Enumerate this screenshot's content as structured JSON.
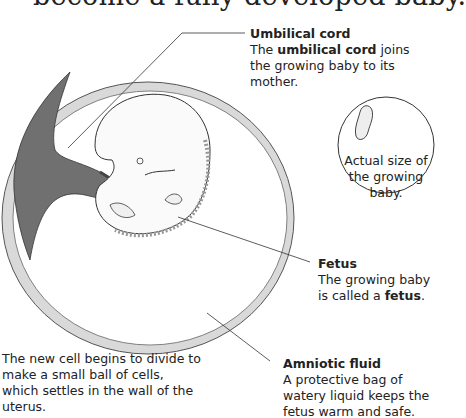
{
  "title": "become a fully developed baby.",
  "labels": {
    "umbilical_cord": {
      "heading": "Umbilical cord",
      "text_before": "The ",
      "bold": "umbilical cord",
      "text_after": " joins the growing baby to its mother."
    },
    "actual_size": {
      "text": "Actual size of the growing baby."
    },
    "fetus": {
      "heading": "Fetus",
      "text_before": "The growing baby is called a ",
      "bold": "fetus",
      "text_after": "."
    },
    "cell_division": {
      "text": "The new cell begins to divide to make a small ball of cells, which settles in the wall of the uterus."
    },
    "amniotic_fluid": {
      "heading": "Amniotic fluid",
      "text": "A protective bag of watery liquid keeps the fetus warm and safe."
    }
  },
  "colors": {
    "sac_wall": "#d6d6d6",
    "placenta": "#6e6e6e",
    "line": "#333333"
  }
}
